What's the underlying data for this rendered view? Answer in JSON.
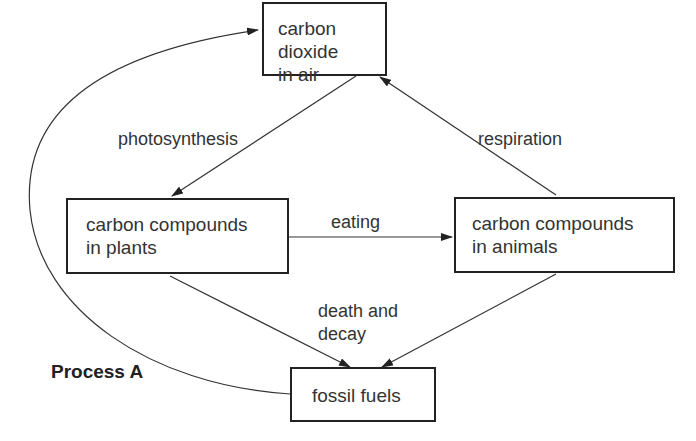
{
  "nodes": {
    "co2": {
      "line1": "carbon dioxide",
      "line2": "in air"
    },
    "plants": {
      "line1": "carbon compounds",
      "line2": "in plants"
    },
    "animals": {
      "line1": "carbon compounds",
      "line2": "in animals"
    },
    "fossil": {
      "line1": "fossil fuels"
    }
  },
  "edges": {
    "photosynthesis": "photosynthesis",
    "respiration": "respiration",
    "eating": "eating",
    "death_decay_1": "death and",
    "death_decay_2": "decay",
    "process_a": "Process A"
  }
}
